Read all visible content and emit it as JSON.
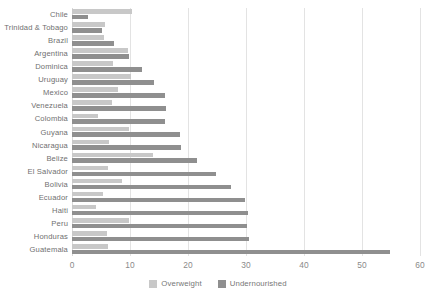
{
  "chart_data": {
    "type": "bar",
    "orientation": "horizontal",
    "title": "",
    "subtitle": "",
    "xlabel": "",
    "ylabel": "",
    "xlim": [
      0,
      60
    ],
    "xticks": [
      0,
      10,
      20,
      30,
      40,
      50,
      60
    ],
    "xtick_labels": [
      "0",
      "10",
      "20",
      "30",
      "40",
      "50",
      "60"
    ],
    "grid": true,
    "grid_axis": "x",
    "legend_position": "bottom-center",
    "categories": [
      "Chile",
      "Trinidad & Tobago",
      "Brazil",
      "Argentina",
      "Dominica",
      "Uruguay",
      "Mexico",
      "Venezuela",
      "Colombia",
      "Guyana",
      "Nicaragua",
      "Belize",
      "El Salvador",
      "Bolivia",
      "Ecuador",
      "Haiti",
      "Peru",
      "Honduras",
      "Guatemala"
    ],
    "series": [
      {
        "name": "Overweight",
        "color": "#c8c8c8",
        "values": [
          10.3,
          5.7,
          5.5,
          9.6,
          7.1,
          10.2,
          7.9,
          6.9,
          4.5,
          9.8,
          6.3,
          14.0,
          6.2,
          8.7,
          5.3,
          4.1,
          9.8,
          6.0,
          6.2
        ]
      },
      {
        "name": "Undernourished",
        "color": "#8f8f8f",
        "values": [
          2.7,
          5.2,
          7.3,
          9.8,
          12.0,
          14.1,
          16.0,
          16.2,
          16.1,
          18.6,
          18.8,
          21.5,
          24.8,
          27.4,
          29.8,
          30.3,
          30.2,
          30.5,
          54.8
        ]
      }
    ]
  },
  "legend": {
    "items": [
      {
        "label": "Overweight",
        "swatch": "overweight"
      },
      {
        "label": "Undernourished",
        "swatch": "undernourished"
      }
    ]
  },
  "colors": {
    "overweight": "#c8c8c8",
    "undernourished": "#8f8f8f",
    "gridline": "#e3e3e3",
    "label_text": "#6f6f6f",
    "tick_text": "#8a8a8a",
    "background": "#ffffff"
  }
}
